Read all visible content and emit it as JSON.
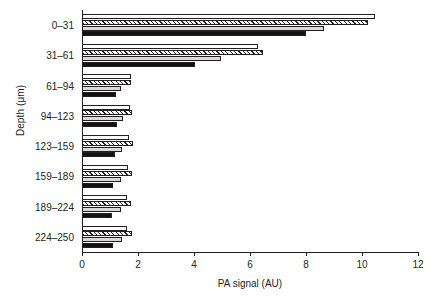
{
  "chart_data": {
    "type": "bar",
    "orientation": "horizontal",
    "title": "",
    "xlabel": "PA signal (AU)",
    "ylabel": "Depth (μm)",
    "categories": [
      "0–31",
      "31–61",
      "61–94",
      "94–123",
      "123–159",
      "159–189",
      "189–224",
      "224–250"
    ],
    "xlim": [
      0,
      12
    ],
    "xticks": [
      0,
      2,
      4,
      6,
      8,
      10,
      12
    ],
    "xtick_labels": [
      "0",
      "2",
      "4",
      "6",
      "8",
      "10",
      "12"
    ],
    "grid": false,
    "legend": "none",
    "series": [
      {
        "name": "series-1-white",
        "fill": "white",
        "values": [
          10.45,
          6.3,
          1.75,
          1.72,
          1.68,
          1.65,
          1.6,
          1.62
        ]
      },
      {
        "name": "series-2-hatch",
        "fill": "hatched",
        "values": [
          10.2,
          6.45,
          1.75,
          1.8,
          1.82,
          1.8,
          1.75,
          1.8
        ]
      },
      {
        "name": "series-3-gray",
        "fill": "gray",
        "values": [
          8.65,
          4.95,
          1.38,
          1.45,
          1.42,
          1.4,
          1.4,
          1.42
        ]
      },
      {
        "name": "series-4-black",
        "fill": "black",
        "values": [
          8.0,
          4.05,
          1.22,
          1.25,
          1.18,
          1.12,
          1.08,
          1.12
        ]
      }
    ]
  },
  "colors": {
    "axis": "#231f20",
    "white_fill": "#ffffff",
    "gray_fill": "#d9d9d9",
    "black_fill": "#121212",
    "hatch_fill": "#fafafa"
  }
}
